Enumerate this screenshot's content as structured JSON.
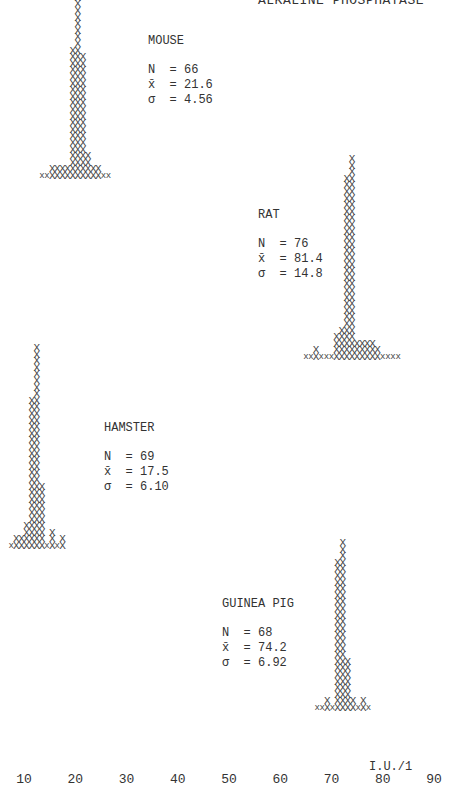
{
  "chart_data": {
    "type": "histogram",
    "title": "ALKALINE PHOSPHATASE",
    "xlabel": "I.U./1",
    "x_ticks": [
      10,
      20,
      30,
      40,
      50,
      60,
      70,
      80,
      90
    ],
    "xlim": [
      7,
      92
    ],
    "series": [
      {
        "name": "MOUSE",
        "N": "66",
        "mean": "21.6",
        "sd": "4.56",
        "baseline_y": 182,
        "label_pos": {
          "left": 148,
          "top": 34
        },
        "columns": [
          {
            "x": 13.5,
            "n": 1,
            "small": true
          },
          {
            "x": 14.5,
            "n": 1,
            "small": true
          },
          {
            "x": 15.5,
            "n": 2
          },
          {
            "x": 16.5,
            "n": 2
          },
          {
            "x": 17.5,
            "n": 2
          },
          {
            "x": 18.5,
            "n": 2
          },
          {
            "x": 19.5,
            "n": 20
          },
          {
            "x": 20.5,
            "n": 28
          },
          {
            "x": 21.5,
            "n": 19
          },
          {
            "x": 22.5,
            "n": 4
          },
          {
            "x": 23.5,
            "n": 2
          },
          {
            "x": 24.5,
            "n": 2
          },
          {
            "x": 25.5,
            "n": 1,
            "small": true
          },
          {
            "x": 26.5,
            "n": 1,
            "small": true
          }
        ]
      },
      {
        "name": "RAT",
        "N": "76",
        "mean": "81.4",
        "sd": "14.8",
        "baseline_y": 363,
        "label_pos": {
          "left": 258,
          "top": 208
        },
        "columns": [
          {
            "x": 65.0,
            "n": 1,
            "small": true
          },
          {
            "x": 66.0,
            "n": 1,
            "small": true
          },
          {
            "x": 67.0,
            "n": 2
          },
          {
            "x": 68.0,
            "n": 1,
            "small": true
          },
          {
            "x": 69.0,
            "n": 1,
            "small": true
          },
          {
            "x": 70.0,
            "n": 1,
            "small": true
          },
          {
            "x": 71.0,
            "n": 4
          },
          {
            "x": 72.0,
            "n": 5
          },
          {
            "x": 73.0,
            "n": 28
          },
          {
            "x": 74.0,
            "n": 31
          },
          {
            "x": 75.0,
            "n": 3
          },
          {
            "x": 76.0,
            "n": 3
          },
          {
            "x": 77.0,
            "n": 3
          },
          {
            "x": 78.0,
            "n": 3
          },
          {
            "x": 79.0,
            "n": 2
          },
          {
            "x": 80.0,
            "n": 1,
            "small": true
          },
          {
            "x": 81.0,
            "n": 1,
            "small": true
          },
          {
            "x": 82.0,
            "n": 1,
            "small": true
          },
          {
            "x": 83.0,
            "n": 1,
            "small": true
          }
        ]
      },
      {
        "name": "HAMSTER",
        "N": "69",
        "mean": "17.5",
        "sd": "6.10",
        "baseline_y": 552,
        "label_pos": {
          "left": 104,
          "top": 421
        },
        "columns": [
          {
            "x": 7.5,
            "n": 1,
            "small": true
          },
          {
            "x": 8.5,
            "n": 2
          },
          {
            "x": 9.5,
            "n": 2
          },
          {
            "x": 10.5,
            "n": 4
          },
          {
            "x": 11.5,
            "n": 23
          },
          {
            "x": 12.5,
            "n": 31
          },
          {
            "x": 13.5,
            "n": 10
          },
          {
            "x": 14.5,
            "n": 1,
            "small": true
          },
          {
            "x": 15.5,
            "n": 3
          },
          {
            "x": 16.5,
            "n": 1,
            "small": true
          },
          {
            "x": 17.5,
            "n": 2
          }
        ]
      },
      {
        "name": "GUINEA PIG",
        "N": "68",
        "mean": "74.2",
        "sd": "6.92",
        "baseline_y": 714,
        "label_pos": {
          "left": 222,
          "top": 597
        },
        "columns": [
          {
            "x": 67.2,
            "n": 1,
            "small": true
          },
          {
            "x": 68.2,
            "n": 1,
            "small": true
          },
          {
            "x": 69.2,
            "n": 2
          },
          {
            "x": 70.2,
            "n": 1,
            "small": true
          },
          {
            "x": 71.2,
            "n": 23
          },
          {
            "x": 72.2,
            "n": 26
          },
          {
            "x": 73.2,
            "n": 8
          },
          {
            "x": 74.2,
            "n": 2
          },
          {
            "x": 75.2,
            "n": 1,
            "small": true
          },
          {
            "x": 76.2,
            "n": 2
          },
          {
            "x": 77.2,
            "n": 1,
            "small": true
          }
        ]
      }
    ]
  },
  "labels": {
    "n_prefix": "N  = ",
    "mean_prefix": "x̄  = ",
    "sd_prefix": "σ  = "
  }
}
